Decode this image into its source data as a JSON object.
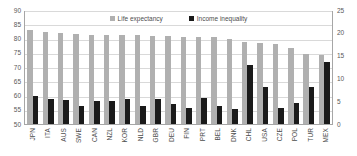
{
  "chart_data": {
    "type": "bar",
    "title": "",
    "xlabel": "",
    "ylabel": "",
    "grid": true,
    "legend_position": "top-center",
    "categories": [
      "JPN",
      "ITA",
      "AUS",
      "SWE",
      "CAN",
      "NZL",
      "KOR",
      "NLD",
      "GBR",
      "DEU",
      "FIN",
      "PRT",
      "BEL",
      "DNK",
      "CHL",
      "USA",
      "CZE",
      "POL",
      "TUR",
      "MEX"
    ],
    "axes": {
      "left": {
        "label": "Life expectancy",
        "min": 50,
        "max": 90,
        "step": 5,
        "ticks": [
          "90",
          "85",
          "80",
          "75",
          "70",
          "65",
          "60",
          "55",
          "50"
        ]
      },
      "right": {
        "label": "Income inequality",
        "min": 0,
        "max": 25,
        "step": 5,
        "ticks": [
          "25",
          "20",
          "15",
          "10",
          "5",
          "0"
        ]
      }
    },
    "series": [
      {
        "name": "Life expectancy",
        "axis": "left",
        "color": "#b0b0b0",
        "values": [
          83.0,
          82.2,
          82.0,
          81.6,
          81.4,
          81.3,
          81.3,
          81.2,
          80.9,
          80.9,
          80.6,
          80.5,
          80.4,
          79.9,
          78.8,
          78.5,
          78.0,
          76.7,
          74.7,
          74.3
        ]
      },
      {
        "name": "Income inequality",
        "axis": "right",
        "color": "#1a1a1a",
        "values": [
          6.2,
          5.5,
          5.3,
          4.0,
          5.1,
          5.1,
          5.4,
          4.0,
          5.5,
          4.3,
          3.6,
          5.7,
          3.9,
          3.4,
          13.0,
          8.2,
          3.6,
          4.6,
          8.2,
          13.6
        ]
      }
    ]
  }
}
